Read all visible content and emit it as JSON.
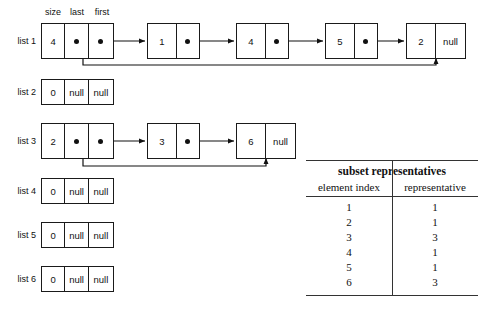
{
  "diagram": {
    "field_captions": [
      "size",
      "last",
      "first"
    ],
    "lists": [
      {
        "label": "list 1",
        "size": "4",
        "last": "pointer",
        "first": "pointer",
        "nodes": [
          {
            "value": "1",
            "next": "pointer"
          },
          {
            "value": "4",
            "next": "pointer"
          },
          {
            "value": "5",
            "next": "pointer"
          },
          {
            "value": "2",
            "next": "null"
          }
        ]
      },
      {
        "label": "list 2",
        "size": "0",
        "last": "null",
        "first": "null",
        "nodes": []
      },
      {
        "label": "list 3",
        "size": "2",
        "last": "pointer",
        "first": "pointer",
        "nodes": [
          {
            "value": "3",
            "next": "pointer"
          },
          {
            "value": "6",
            "next": "null"
          }
        ]
      },
      {
        "label": "list 4",
        "size": "0",
        "last": "null",
        "first": "null",
        "nodes": []
      },
      {
        "label": "list 5",
        "size": "0",
        "last": "null",
        "first": "null",
        "nodes": []
      },
      {
        "label": "list 6",
        "size": "0",
        "last": "null",
        "first": "null",
        "nodes": []
      }
    ]
  },
  "table": {
    "title": "subset representatives",
    "columns": [
      "element index",
      "representative"
    ],
    "rows": [
      [
        "1",
        "1"
      ],
      [
        "2",
        "1"
      ],
      [
        "3",
        "3"
      ],
      [
        "4",
        "1"
      ],
      [
        "5",
        "1"
      ],
      [
        "6",
        "3"
      ]
    ]
  },
  "colors": {
    "stroke": "#1a1a1a",
    "rule": "#333333",
    "background": "#ffffff"
  }
}
